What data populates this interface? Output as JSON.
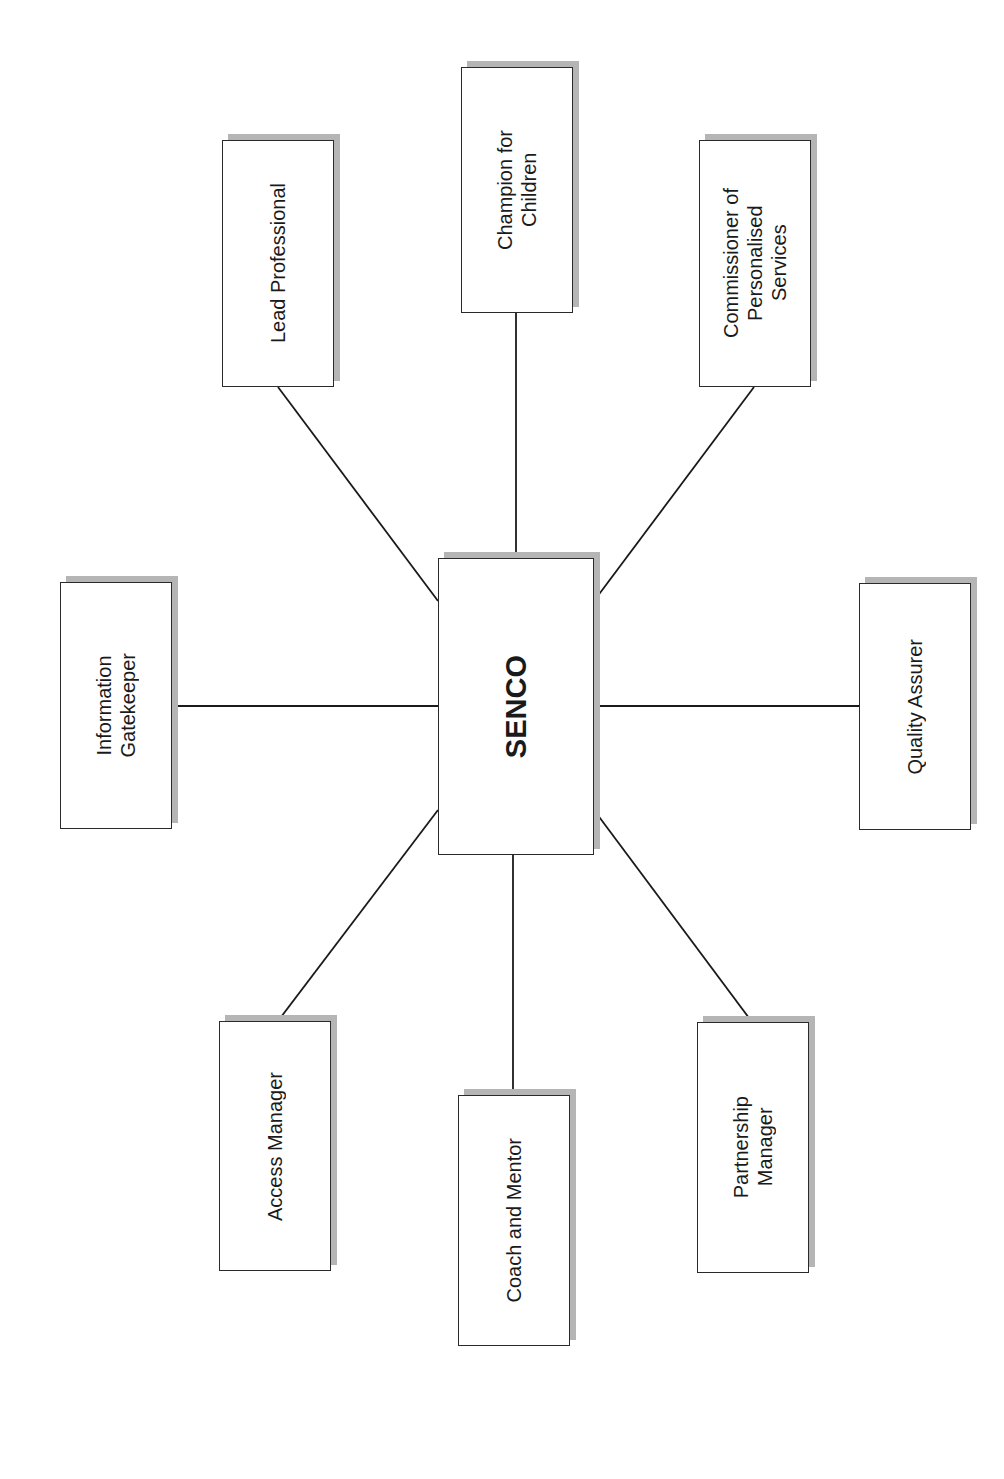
{
  "diagram": {
    "center": {
      "label": "SENCO",
      "box": {
        "x": 438,
        "y": 558,
        "w": 156,
        "h": 297
      }
    },
    "nodes": [
      {
        "id": "champion-for-children",
        "label": "Champion for\nChildren",
        "box": {
          "x": 461,
          "y": 67,
          "w": 112,
          "h": 246
        }
      },
      {
        "id": "lead-professional",
        "label": "Lead Professional",
        "box": {
          "x": 222,
          "y": 140,
          "w": 112,
          "h": 247
        }
      },
      {
        "id": "commissioner-of-personalised-services",
        "label": "Commissioner of\nPersonalised\nServices",
        "box": {
          "x": 699,
          "y": 140,
          "w": 112,
          "h": 247
        }
      },
      {
        "id": "information-gatekeeper",
        "label": "Information\nGatekeeper",
        "box": {
          "x": 60,
          "y": 582,
          "w": 112,
          "h": 247
        }
      },
      {
        "id": "quality-assurer",
        "label": "Quality Assurer",
        "box": {
          "x": 859,
          "y": 583,
          "w": 112,
          "h": 247
        }
      },
      {
        "id": "access-manager",
        "label": "Access Manager",
        "box": {
          "x": 219,
          "y": 1021,
          "w": 112,
          "h": 250
        }
      },
      {
        "id": "coach-and-mentor",
        "label": "Coach and Mentor",
        "box": {
          "x": 458,
          "y": 1095,
          "w": 112,
          "h": 251
        }
      },
      {
        "id": "partnership-manager",
        "label": "Partnership\nManager",
        "box": {
          "x": 697,
          "y": 1022,
          "w": 112,
          "h": 251
        }
      }
    ],
    "edges": [
      {
        "from": "SENCO",
        "to": "champion-for-children",
        "x1": 516,
        "y1": 558,
        "x2": 516,
        "y2": 313
      },
      {
        "from": "SENCO",
        "to": "lead-professional",
        "x1": 438,
        "y1": 601,
        "x2": 278,
        "y2": 387
      },
      {
        "from": "SENCO",
        "to": "commissioner-of-personalised-services",
        "x1": 594,
        "y1": 601,
        "x2": 754,
        "y2": 387
      },
      {
        "from": "SENCO",
        "to": "information-gatekeeper",
        "x1": 438,
        "y1": 706,
        "x2": 172,
        "y2": 706
      },
      {
        "from": "SENCO",
        "to": "quality-assurer",
        "x1": 594,
        "y1": 706,
        "x2": 859,
        "y2": 706
      },
      {
        "from": "SENCO",
        "to": "access-manager",
        "x1": 438,
        "y1": 810,
        "x2": 278,
        "y2": 1021
      },
      {
        "from": "SENCO",
        "to": "coach-and-mentor",
        "x1": 513,
        "y1": 855,
        "x2": 513,
        "y2": 1095
      },
      {
        "from": "SENCO",
        "to": "partnership-manager",
        "x1": 594,
        "y1": 810,
        "x2": 752,
        "y2": 1022
      }
    ],
    "colors": {
      "line": "#1a1a1a",
      "border": "#2a2a2a",
      "shadow": "#b5b5b5",
      "background": "#ffffff"
    }
  }
}
